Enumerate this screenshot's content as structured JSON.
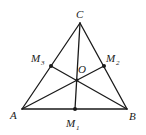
{
  "diagram": {
    "title": "",
    "stroke_color": "#1a1a1a",
    "points": {
      "A": {
        "label": "A",
        "x": 22,
        "y": 109
      },
      "B": {
        "label": "B",
        "x": 127,
        "y": 109
      },
      "C": {
        "label": "C",
        "x": 80,
        "y": 23
      },
      "M1": {
        "label": "M",
        "sub": "1",
        "x": 75,
        "y": 109
      },
      "M2": {
        "label": "M",
        "sub": "2",
        "x": 104,
        "y": 66
      },
      "M3": {
        "label": "M",
        "sub": "3",
        "x": 51,
        "y": 66
      },
      "O": {
        "label": "O",
        "x": 77,
        "y": 80
      }
    },
    "segments": [
      [
        "A",
        "B"
      ],
      [
        "B",
        "C"
      ],
      [
        "C",
        "A"
      ],
      [
        "C",
        "M1"
      ],
      [
        "A",
        "M2"
      ],
      [
        "B",
        "M3"
      ]
    ]
  }
}
